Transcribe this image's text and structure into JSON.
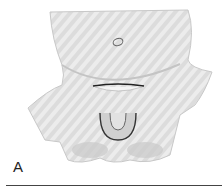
{
  "figure": {
    "panel_label": "A",
    "colors": {
      "skin": "#d9d9d9",
      "shade": "#b0b0b0",
      "line": "#333333"
    }
  }
}
